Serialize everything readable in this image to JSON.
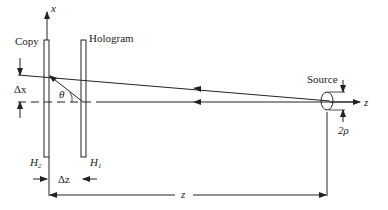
{
  "diagram": {
    "labels": {
      "copy": "Copy",
      "hologram": "Hologram",
      "source": "Source",
      "x_axis": "x",
      "z_axis": "z",
      "theta": "θ",
      "delta_x": "Δx",
      "delta_z": "Δz",
      "two_rho": "2ρ",
      "z_distance": "z",
      "h2": "H",
      "h2_sub": "2",
      "h1": "H",
      "h1_sub": "1"
    },
    "colors": {
      "stroke": "#222222",
      "background": "#ffffff"
    }
  }
}
